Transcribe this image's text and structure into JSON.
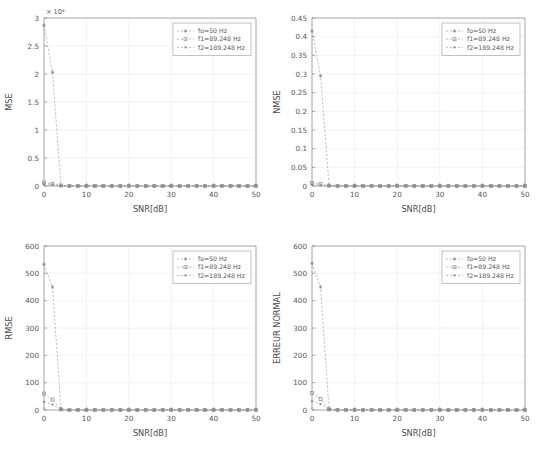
{
  "figure": {
    "background": "#ffffff",
    "axis_color": "#8a8a8a",
    "grid_color": "#e9e9e9",
    "series_color": "#9a9a9a",
    "panel_count": 4,
    "layout": "2x2"
  },
  "legend": {
    "position": "top-right",
    "entries": [
      {
        "label": "fo=50 Hz",
        "marker": "star-marker",
        "line": "dashed"
      },
      {
        "label": "f1=89.248 Hz",
        "marker": "square-marker",
        "line": "dashed"
      },
      {
        "label": "f2=189.248 Hz",
        "marker": "dot-marker",
        "line": "dashed"
      }
    ]
  },
  "chart_data": [
    {
      "id": "mse",
      "type": "line",
      "title": "",
      "xlabel": "SNR[dB]",
      "ylabel": "MSE",
      "xlim": [
        0,
        50
      ],
      "ylim": [
        0,
        3
      ],
      "xticks": [
        0,
        10,
        20,
        30,
        40,
        50
      ],
      "xtick_labels": [
        "0",
        "10",
        "20",
        "30",
        "40",
        "50"
      ],
      "yticks": [
        0,
        0.5,
        1,
        1.5,
        2,
        2.5,
        3
      ],
      "ytick_labels": [
        "0",
        "0.5",
        "1",
        "1.5",
        "2",
        "2.5",
        "3"
      ],
      "y_exponent_label": "× 10⁵",
      "grid": true,
      "x": [
        0,
        2,
        4,
        6,
        8,
        10,
        12,
        14,
        16,
        18,
        20,
        22,
        24,
        26,
        28,
        30,
        32,
        34,
        36,
        38,
        40,
        42,
        44,
        46,
        48,
        50
      ],
      "series": [
        {
          "name": "fo=50 Hz",
          "values": [
            2.87,
            2.03,
            0.01,
            0,
            0,
            0,
            0,
            0,
            0,
            0,
            0,
            0,
            0,
            0,
            0,
            0,
            0,
            0,
            0,
            0,
            0,
            0,
            0,
            0,
            0,
            0
          ]
        },
        {
          "name": "f1=89.248 Hz",
          "values": [
            0.06,
            0.04,
            0.01,
            0,
            0,
            0,
            0,
            0,
            0,
            0,
            0,
            0,
            0,
            0,
            0,
            0,
            0,
            0,
            0,
            0,
            0,
            0,
            0,
            0,
            0,
            0
          ]
        },
        {
          "name": "f2=189.248 Hz",
          "values": [
            0.03,
            0.02,
            0.0,
            0,
            0,
            0,
            0,
            0,
            0,
            0,
            0,
            0,
            0,
            0,
            0,
            0,
            0,
            0,
            0,
            0,
            0,
            0,
            0,
            0,
            0,
            0
          ]
        }
      ]
    },
    {
      "id": "nmse",
      "type": "line",
      "title": "",
      "xlabel": "SNR[dB]",
      "ylabel": "NMSE",
      "xlim": [
        0,
        50
      ],
      "ylim": [
        0,
        0.45
      ],
      "xticks": [
        0,
        10,
        20,
        30,
        40,
        50
      ],
      "xtick_labels": [
        "0",
        "10",
        "20",
        "30",
        "40",
        "50"
      ],
      "yticks": [
        0,
        0.05,
        0.1,
        0.15,
        0.2,
        0.25,
        0.3,
        0.35,
        0.4,
        0.45
      ],
      "ytick_labels": [
        "0",
        "0.05",
        "0.1",
        "0.15",
        "0.2",
        "0.25",
        "0.3",
        "0.35",
        "0.4",
        "0.45"
      ],
      "y_exponent_label": "",
      "grid": true,
      "x": [
        0,
        2,
        4,
        6,
        8,
        10,
        12,
        14,
        16,
        18,
        20,
        22,
        24,
        26,
        28,
        30,
        32,
        34,
        36,
        38,
        40,
        42,
        44,
        46,
        48,
        50
      ],
      "series": [
        {
          "name": "fo=50 Hz",
          "values": [
            0.415,
            0.295,
            0.002,
            0,
            0,
            0,
            0,
            0,
            0,
            0,
            0,
            0,
            0,
            0,
            0,
            0,
            0,
            0,
            0,
            0,
            0,
            0,
            0,
            0,
            0,
            0
          ]
        },
        {
          "name": "f1=89.248 Hz",
          "values": [
            0.008,
            0.005,
            0.001,
            0,
            0,
            0,
            0,
            0,
            0,
            0,
            0,
            0,
            0,
            0,
            0,
            0,
            0,
            0,
            0,
            0,
            0,
            0,
            0,
            0,
            0,
            0
          ]
        },
        {
          "name": "f2=189.248 Hz",
          "values": [
            0.004,
            0.002,
            0.0,
            0,
            0,
            0,
            0,
            0,
            0,
            0,
            0,
            0,
            0,
            0,
            0,
            0,
            0,
            0,
            0,
            0,
            0,
            0,
            0,
            0,
            0,
            0
          ]
        }
      ]
    },
    {
      "id": "rmse",
      "type": "line",
      "title": "",
      "xlabel": "SNR[dB]",
      "ylabel": "RMSE",
      "xlim": [
        0,
        50
      ],
      "ylim": [
        0,
        600
      ],
      "xticks": [
        0,
        10,
        20,
        30,
        40,
        50
      ],
      "xtick_labels": [
        "0",
        "10",
        "20",
        "30",
        "40",
        "50"
      ],
      "yticks": [
        0,
        100,
        200,
        300,
        400,
        500,
        600
      ],
      "ytick_labels": [
        "0",
        "100",
        "200",
        "300",
        "400",
        "500",
        "600"
      ],
      "y_exponent_label": "",
      "grid": true,
      "x": [
        0,
        2,
        4,
        6,
        8,
        10,
        12,
        14,
        16,
        18,
        20,
        22,
        24,
        26,
        28,
        30,
        32,
        34,
        36,
        38,
        40,
        42,
        44,
        46,
        48,
        50
      ],
      "series": [
        {
          "name": "fo=50 Hz",
          "values": [
            533,
            450,
            4,
            0,
            0,
            0,
            0,
            0,
            0,
            0,
            0,
            0,
            0,
            0,
            0,
            0,
            0,
            0,
            0,
            0,
            0,
            0,
            0,
            0,
            0,
            0
          ]
        },
        {
          "name": "f1=89.248 Hz",
          "values": [
            60,
            38,
            2,
            0,
            0,
            0,
            0,
            0,
            0,
            0,
            0,
            0,
            0,
            0,
            0,
            0,
            0,
            0,
            0,
            0,
            0,
            0,
            0,
            0,
            0,
            0
          ]
        },
        {
          "name": "f2=189.248 Hz",
          "values": [
            30,
            20,
            1,
            0,
            0,
            0,
            0,
            0,
            0,
            0,
            0,
            0,
            0,
            0,
            0,
            0,
            0,
            0,
            0,
            0,
            0,
            0,
            0,
            0,
            0,
            0
          ]
        }
      ]
    },
    {
      "id": "erreur-normal",
      "type": "line",
      "title": "",
      "xlabel": "SNR[dB]",
      "ylabel": "ERREUR NORMAL",
      "xlim": [
        0,
        50
      ],
      "ylim": [
        0,
        600
      ],
      "xticks": [
        0,
        10,
        20,
        30,
        40,
        50
      ],
      "xtick_labels": [
        "0",
        "10",
        "20",
        "30",
        "40",
        "50"
      ],
      "yticks": [
        0,
        100,
        200,
        300,
        400,
        500,
        600
      ],
      "ytick_labels": [
        "0",
        "100",
        "200",
        "300",
        "400",
        "500",
        "600"
      ],
      "y_exponent_label": "",
      "grid": true,
      "x": [
        0,
        2,
        4,
        6,
        8,
        10,
        12,
        14,
        16,
        18,
        20,
        22,
        24,
        26,
        28,
        30,
        32,
        34,
        36,
        38,
        40,
        42,
        44,
        46,
        48,
        50
      ],
      "series": [
        {
          "name": "fo=50 Hz",
          "values": [
            537,
            450,
            5,
            0,
            0,
            0,
            0,
            0,
            0,
            0,
            0,
            0,
            0,
            0,
            0,
            0,
            0,
            0,
            0,
            0,
            0,
            0,
            0,
            0,
            0,
            0
          ]
        },
        {
          "name": "f1=89.248 Hz",
          "values": [
            62,
            40,
            2,
            0,
            0,
            0,
            0,
            0,
            0,
            0,
            0,
            0,
            0,
            0,
            0,
            0,
            0,
            0,
            0,
            0,
            0,
            0,
            0,
            0,
            0,
            0
          ]
        },
        {
          "name": "f2=189.248 Hz",
          "values": [
            32,
            22,
            1,
            0,
            0,
            0,
            0,
            0,
            0,
            0,
            0,
            0,
            0,
            0,
            0,
            0,
            0,
            0,
            0,
            0,
            0,
            0,
            0,
            0,
            0,
            0
          ]
        }
      ]
    }
  ]
}
